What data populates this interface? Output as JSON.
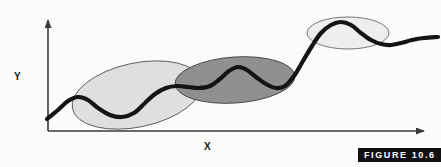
{
  "figure": {
    "caption": "FIGURE 10.6",
    "background_color": "#fbfbfa"
  },
  "axes": {
    "x_label": "X",
    "y_label": "Y",
    "axis_color": "#3a3a3a",
    "origin": [
      48,
      131
    ],
    "x_axis_end": [
      430,
      131
    ],
    "y_axis_end": [
      48,
      14
    ]
  },
  "chart_data": {
    "type": "line",
    "title": "",
    "xlabel": "X",
    "ylabel": "Y",
    "grid": false,
    "legend": "none",
    "xlim": [
      0,
      441
    ],
    "ylim": [
      0,
      167
    ],
    "series": [
      {
        "name": "wavy-trend-curve",
        "color": "#141414",
        "line_width": 4.2,
        "points": [
          [
            47,
            119
          ],
          [
            58,
            110
          ],
          [
            68,
            101
          ],
          [
            78,
            97
          ],
          [
            88,
            100
          ],
          [
            98,
            108
          ],
          [
            110,
            115
          ],
          [
            122,
            117
          ],
          [
            134,
            113
          ],
          [
            145,
            103
          ],
          [
            155,
            94
          ],
          [
            166,
            88
          ],
          [
            177,
            86
          ],
          [
            188,
            87
          ],
          [
            199,
            88
          ],
          [
            210,
            86
          ],
          [
            220,
            79
          ],
          [
            229,
            71
          ],
          [
            238,
            67
          ],
          [
            247,
            70
          ],
          [
            256,
            77
          ],
          [
            266,
            84
          ],
          [
            276,
            88
          ],
          [
            285,
            86
          ],
          [
            294,
            76
          ],
          [
            303,
            61
          ],
          [
            312,
            46
          ],
          [
            321,
            33
          ],
          [
            331,
            25
          ],
          [
            341,
            22
          ],
          [
            351,
            25
          ],
          [
            361,
            33
          ],
          [
            371,
            40
          ],
          [
            381,
            44
          ],
          [
            391,
            45
          ],
          [
            401,
            43
          ],
          [
            412,
            40
          ],
          [
            424,
            38
          ],
          [
            438,
            37
          ]
        ]
      }
    ],
    "regions": [
      {
        "name": "cluster-ellipse-left",
        "label": "",
        "fill": "#d9d9d9",
        "fill_opacity": 0.85,
        "stroke": "#5a5a5a",
        "stroke_width": 0.9,
        "cx": 137,
        "cy": 95,
        "rx": 66,
        "ry": 32,
        "rotation_deg": -12
      },
      {
        "name": "cluster-ellipse-middle",
        "label": "",
        "fill": "#8a8a8a",
        "fill_opacity": 0.95,
        "stroke": "#3d3d3d",
        "stroke_width": 0.9,
        "cx": 235,
        "cy": 80,
        "rx": 60,
        "ry": 23,
        "rotation_deg": -4
      },
      {
        "name": "cluster-ellipse-right",
        "label": "",
        "fill": "#ececec",
        "fill_opacity": 0.9,
        "stroke": "#6a6a6a",
        "stroke_width": 0.9,
        "cx": 348,
        "cy": 33,
        "rx": 41,
        "ry": 16,
        "rotation_deg": 0
      }
    ]
  }
}
